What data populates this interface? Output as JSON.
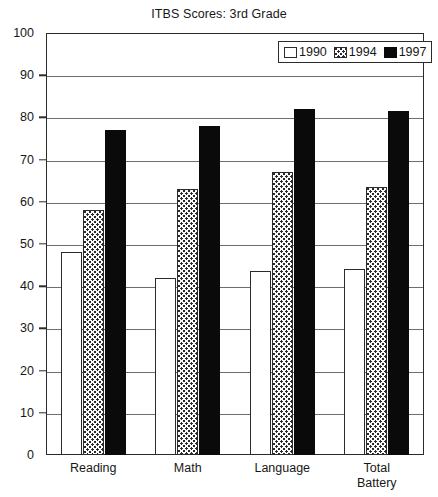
{
  "chart_data": {
    "type": "bar",
    "title": "ITBS Scores: 3rd Grade",
    "xlabel": "",
    "ylabel": "",
    "ylim": [
      0,
      100
    ],
    "ytick_step": 10,
    "yticks": [
      0,
      10,
      20,
      30,
      40,
      50,
      60,
      70,
      80,
      90,
      100
    ],
    "grid": true,
    "legend_position": "top-right",
    "categories": [
      "Reading",
      "Math",
      "Language",
      "Total\nBattery"
    ],
    "series": [
      {
        "name": "1990",
        "values": [
          48,
          42,
          43.5,
          44
        ],
        "fill": "white",
        "color": "#ffffff"
      },
      {
        "name": "1994",
        "values": [
          58,
          63,
          67,
          63.5
        ],
        "fill": "dotted",
        "color": "#fdfdfd"
      },
      {
        "name": "1997",
        "values": [
          77,
          78,
          82,
          81.5
        ],
        "fill": "solid",
        "color": "#0a0a0a"
      }
    ]
  },
  "legend": {
    "entries": [
      {
        "label": "1990",
        "swatch": "swatch-white-icon"
      },
      {
        "label": "1994",
        "swatch": "swatch-dotted-icon"
      },
      {
        "label": "1997",
        "swatch": "swatch-black-icon"
      }
    ]
  },
  "colors": {
    "axis": "#2b2b2b",
    "grid": "#6e6e6e",
    "text": "#171717",
    "series_1990": "#ffffff",
    "series_1994": "#fdfdfd",
    "series_1997": "#0a0a0a",
    "background": "#ffffff"
  }
}
